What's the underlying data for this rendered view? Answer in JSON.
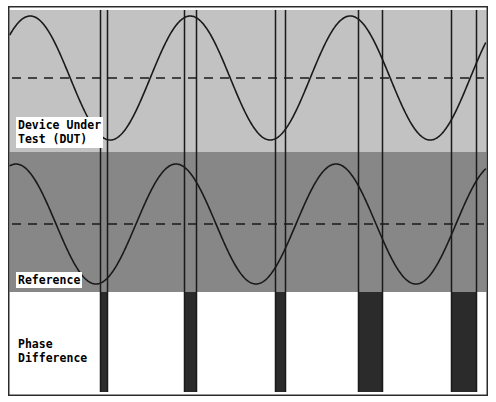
{
  "figure": {
    "width": 496,
    "height": 402
  },
  "labels": {
    "dut": "Device Under\nTest (DUT)",
    "reference": "Reference",
    "phase_difference": "Phase\nDifference"
  },
  "colors": {
    "background": "#ffffff",
    "dut_band": "#c2c2c2",
    "reference_band": "#878787",
    "phase_band": "#ffffff",
    "trace": "#1a1a1a",
    "marker_line": "#1a1a1a",
    "zero_dash": "#1a1a1a",
    "bar_fill": "#2b2b2b",
    "border": "#2b2b2b"
  },
  "chart_data": {
    "type": "line",
    "xlabel": "",
    "ylabel": "",
    "xlim": [
      0,
      480
    ],
    "ylim": [
      0,
      390
    ],
    "grid": false,
    "legend": "none",
    "panels": [
      {
        "name": "Device Under Test (DUT)",
        "band_top": 4,
        "band_bottom": 146,
        "background": "#c2c2c2",
        "zero_line_y": 72,
        "zero_line_style": "dashed",
        "series": [
          {
            "name": "dut-sine",
            "type": "sine",
            "amplitude": 62,
            "period": 160,
            "phase_deg": 40,
            "baseline_y": 72,
            "color": "#1a1a1a"
          }
        ]
      },
      {
        "name": "Reference",
        "band_top": 146,
        "band_bottom": 286,
        "background": "#878787",
        "zero_line_y": 218,
        "zero_line_style": "dashed",
        "series": [
          {
            "name": "reference-sine",
            "type": "sine",
            "amplitude": 60,
            "period": 160,
            "phase_deg": 72,
            "baseline_y": 218,
            "color": "#1a1a1a"
          }
        ]
      },
      {
        "name": "Phase Difference",
        "band_top": 286,
        "band_bottom": 386,
        "background": "#ffffff",
        "series": [
          {
            "name": "phase-difference-bars",
            "type": "bar",
            "color": "#2b2b2b",
            "bar_top": 286,
            "bar_bottom": 386,
            "bars": [
              {
                "x_start": 92,
                "x_end": 99,
                "width": 7
              },
              {
                "x_start": 176,
                "x_end": 188,
                "width": 12
              },
              {
                "x_start": 267,
                "x_end": 277,
                "width": 10
              },
              {
                "x_start": 350,
                "x_end": 374,
                "width": 24
              },
              {
                "x_start": 443,
                "x_end": 468,
                "width": 25
              }
            ]
          }
        ]
      }
    ],
    "marker_lines": [
      {
        "name": "dut-zero-cross-1",
        "x": 92,
        "y_top": 4,
        "y_bottom": 386,
        "source": "dut"
      },
      {
        "name": "ref-zero-cross-1",
        "x": 99,
        "y_top": 4,
        "y_bottom": 386,
        "source": "reference"
      },
      {
        "name": "dut-zero-cross-2",
        "x": 176,
        "y_top": 4,
        "y_bottom": 386,
        "source": "dut"
      },
      {
        "name": "ref-zero-cross-2",
        "x": 188,
        "y_top": 4,
        "y_bottom": 386,
        "source": "reference"
      },
      {
        "name": "dut-zero-cross-3",
        "x": 267,
        "y_top": 4,
        "y_bottom": 386,
        "source": "dut"
      },
      {
        "name": "ref-zero-cross-3",
        "x": 277,
        "y_top": 4,
        "y_bottom": 386,
        "source": "reference"
      },
      {
        "name": "dut-zero-cross-4",
        "x": 350,
        "y_top": 4,
        "y_bottom": 386,
        "source": "dut"
      },
      {
        "name": "ref-zero-cross-4",
        "x": 374,
        "y_top": 4,
        "y_bottom": 386,
        "source": "reference"
      },
      {
        "name": "dut-zero-cross-5",
        "x": 443,
        "y_top": 4,
        "y_bottom": 386,
        "source": "dut"
      },
      {
        "name": "ref-zero-cross-5",
        "x": 468,
        "y_top": 4,
        "y_bottom": 386,
        "source": "reference"
      }
    ]
  }
}
